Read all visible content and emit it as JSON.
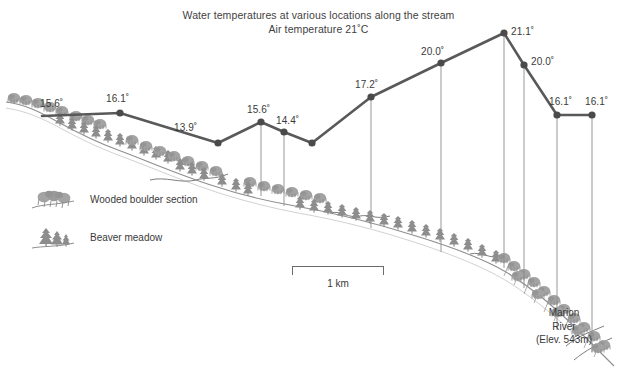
{
  "title": {
    "line1": "Water temperatures at various locations along the stream",
    "line2": "Air temperature 21˚C"
  },
  "legend": {
    "items": [
      {
        "symbol": "boulder-cluster",
        "label": "Wooded boulder section"
      },
      {
        "symbol": "conifer-cluster",
        "label": "Beaver meadow"
      }
    ]
  },
  "scale_bar": {
    "label": "1 km"
  },
  "river_label": {
    "name": "Marion",
    "type": "River",
    "elevation": "(Elev. 543m)"
  },
  "colors": {
    "line": "#595959",
    "marker": "#4a4a4a",
    "dropline": "#8c8c8c",
    "terrain": "#9a9a9a",
    "vegetation": "#8f8f8f",
    "text": "#3a3a3a"
  },
  "chart_data": {
    "type": "line",
    "title": "Water temperatures at various locations along the stream",
    "subtitle": "Air temperature 21˚C",
    "xlabel": "Distance along stream",
    "ylabel": "Water temperature (˚C)",
    "units": "˚C",
    "air_temperature": 21.0,
    "grid": false,
    "legend_position": "left-middle",
    "scale_bar_km": 1,
    "series": [
      {
        "name": "Water temperature",
        "points": [
          {
            "label": "15.6˚",
            "value": 15.6,
            "x": 42,
            "y": 116,
            "marker": false,
            "dropline": false,
            "label_x": 40,
            "label_y": 98
          },
          {
            "label": "16.1˚",
            "value": 16.1,
            "x": 120,
            "y": 113,
            "marker": true,
            "dropline": false,
            "label_x": 106,
            "label_y": 93
          },
          {
            "label": "13.9˚",
            "value": 13.9,
            "x": 218,
            "y": 143,
            "marker": true,
            "dropline": false,
            "label_x": 174,
            "label_y": 122
          },
          {
            "label": "15.6˚",
            "value": 15.6,
            "x": 261,
            "y": 122,
            "marker": true,
            "dropline": true,
            "dropline_y": 196,
            "label_x": 247,
            "label_y": 104
          },
          {
            "label": "14.4˚",
            "value": 14.4,
            "x": 284,
            "y": 132,
            "marker": true,
            "dropline": true,
            "dropline_y": 206,
            "label_x": 276,
            "label_y": 115
          },
          {
            "label": "",
            "value": null,
            "x": 312,
            "y": 143,
            "marker": true,
            "dropline": false
          },
          {
            "label": "17.2˚",
            "value": 17.2,
            "x": 371,
            "y": 97,
            "marker": true,
            "dropline": true,
            "dropline_y": 228,
            "label_x": 355,
            "label_y": 79
          },
          {
            "label": "20.0˚",
            "value": 20.0,
            "x": 441,
            "y": 63,
            "marker": true,
            "dropline": true,
            "dropline_y": 252,
            "label_x": 421,
            "label_y": 46
          },
          {
            "label": "21.1˚",
            "value": 21.1,
            "x": 504,
            "y": 33,
            "marker": true,
            "dropline": true,
            "dropline_y": 268,
            "label_x": 511,
            "label_y": 26
          },
          {
            "label": "20.0˚",
            "value": 20.0,
            "x": 524,
            "y": 65,
            "marker": true,
            "dropline": true,
            "dropline_y": 288,
            "label_x": 531,
            "label_y": 56
          },
          {
            "label": "16.1˚",
            "value": 16.1,
            "x": 557,
            "y": 115,
            "marker": true,
            "dropline": true,
            "dropline_y": 330,
            "label_x": 549,
            "label_y": 96
          },
          {
            "label": "16.1˚",
            "value": 16.1,
            "x": 592,
            "y": 115,
            "marker": true,
            "dropline": true,
            "dropline_y": 352,
            "label_x": 585,
            "label_y": 96
          }
        ]
      }
    ]
  }
}
